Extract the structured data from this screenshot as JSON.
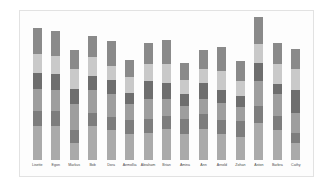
{
  "chart_data": {
    "type": "bar",
    "subtype": "stacked-vertical",
    "title": "",
    "subtitle": "",
    "xlabel": "",
    "ylabel": "",
    "grid": false,
    "legend": "none",
    "axis_visible": false,
    "ylim": [
      0,
      100
    ],
    "categories": [
      "Lisette",
      "Egon",
      "Markus",
      "Bob",
      "Dora",
      "Aemollia",
      "Abraham",
      "Brian",
      "Amina",
      "Ann",
      "Arnold",
      "Zohan",
      "Aston",
      "Barbra",
      "Cathy"
    ],
    "series": [
      {
        "name": "segment-1-bottom",
        "color": "#aaaaaa",
        "values": [
          24,
          24,
          12,
          24,
          21,
          18,
          19,
          22,
          18,
          22,
          18,
          16,
          26,
          21,
          12
        ]
      },
      {
        "name": "segment-2",
        "color": "#7d7d7d",
        "values": [
          10,
          10,
          9,
          9,
          9,
          10,
          10,
          9,
          11,
          10,
          10,
          11,
          12,
          10,
          7
        ]
      },
      {
        "name": "segment-3-middle",
        "color": "#9e9e9e",
        "values": [
          16,
          15,
          18,
          16,
          16,
          11,
          14,
          12,
          9,
          11,
          12,
          10,
          17,
          15,
          14
        ]
      },
      {
        "name": "segment-4-dark",
        "color": "#6e6e6e",
        "values": [
          11,
          11,
          11,
          10,
          10,
          8,
          12,
          11,
          8,
          11,
          9,
          8,
          13,
          7,
          16
        ]
      },
      {
        "name": "segment-5-light",
        "color": "#c9c9c9",
        "values": [
          13,
          13,
          14,
          13,
          10,
          11,
          12,
          13,
          10,
          10,
          13,
          10,
          13,
          14,
          15
        ]
      },
      {
        "name": "segment-6-top",
        "color": "#8a8a8a",
        "values": [
          18,
          17,
          13,
          15,
          17,
          12,
          15,
          17,
          12,
          13,
          17,
          14,
          19,
          15,
          14
        ]
      }
    ],
    "totals": [
      92,
      90,
      77,
      87,
      83,
      70,
      82,
      84,
      68,
      77,
      79,
      69,
      100,
      82,
      78
    ],
    "palette": {
      "background": "#ffffff",
      "plot_background": "#fdfdfd",
      "frame_border": "#e2e2e2",
      "label_text": "#4a4a4a"
    }
  }
}
